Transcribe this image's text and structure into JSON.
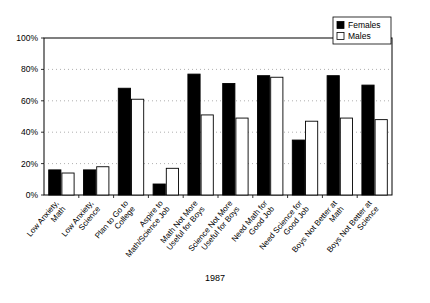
{
  "chart_data": {
    "type": "bar",
    "title": "1987",
    "title_position": "bottom",
    "xlabel": "",
    "ylabel": "",
    "ylim": [
      0,
      100
    ],
    "yticks": [
      0,
      20,
      40,
      60,
      80,
      100
    ],
    "ytick_labels": [
      "0%",
      "20%",
      "40%",
      "60%",
      "80%",
      "100%"
    ],
    "grid": true,
    "grid_style": "dotted-horizontal",
    "legend_position": "top-right",
    "categories": [
      "Low Anxiety, Math",
      "Low Anxiety, Science",
      "Plan to Go to College",
      "Aspire to Math/Science Job",
      "Math Not More Useful for Boys",
      "Science Not More Useful for Boys",
      "Need Math for Good Job",
      "Need Science for Good Job",
      "Boys Not Better at Math",
      "Boys Not Better at Science"
    ],
    "category_lines": [
      [
        "Low Anxiety,",
        "Math"
      ],
      [
        "Low Anxiety,",
        "Science"
      ],
      [
        "Plan to Go to",
        "College"
      ],
      [
        "Aspire to",
        "Math/Science Job"
      ],
      [
        "Math Not More",
        "Useful for Boys"
      ],
      [
        "Science Not More",
        "Useful for Boys"
      ],
      [
        "Need Math for",
        "Good Job"
      ],
      [
        "Need Science for",
        "Good Job"
      ],
      [
        "Boys Not Better at",
        "Math"
      ],
      [
        "Boys Not Better at",
        "Science"
      ]
    ],
    "series": [
      {
        "name": "Females",
        "color": "#000000",
        "fill": "solid",
        "values": [
          16,
          16,
          68,
          7,
          77,
          71,
          76,
          35,
          76,
          70
        ]
      },
      {
        "name": "Males",
        "color": "#ffffff",
        "fill": "open",
        "values": [
          14,
          18,
          61,
          17,
          51,
          49,
          75,
          47,
          49,
          48
        ]
      }
    ]
  },
  "legend": {
    "items": [
      {
        "label": "Females",
        "swatch": "solid-black-square"
      },
      {
        "label": "Males",
        "swatch": "open-white-square"
      }
    ]
  }
}
